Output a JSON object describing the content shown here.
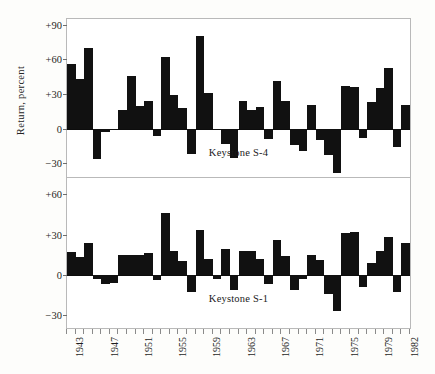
{
  "figure": {
    "y_axis_title": "Return, percent",
    "x_start_year": 1943,
    "x_end_year": 1982
  },
  "panels": [
    {
      "caption": "Keystone S-4",
      "y_ticks": [
        "+90",
        "+60",
        "+30",
        "0",
        "-30"
      ],
      "y_tick_values": [
        90,
        60,
        30,
        0,
        -30
      ]
    },
    {
      "caption": "Keystone S-1",
      "y_ticks": [
        "+60",
        "+30",
        "0",
        "-30"
      ],
      "y_tick_values": [
        60,
        30,
        0,
        -30
      ]
    }
  ],
  "x_tick_labels": [
    "1943",
    "1947",
    "1951",
    "1955",
    "1959",
    "1963",
    "1967",
    "1971",
    "1975",
    "1979",
    "1982"
  ],
  "colors": {
    "bar": "#111111",
    "frame": "#b9b9b9",
    "baseline": "#0d0d0d",
    "background": "#fdfdfb",
    "text": "#1a1a1a"
  },
  "chart_data": [
    {
      "type": "bar",
      "title": "Keystone S-4",
      "xlabel": "",
      "ylabel": "Return, percent",
      "ylim": [
        -40,
        95
      ],
      "yticks": [
        -30,
        0,
        30,
        60,
        90
      ],
      "grid": false,
      "legend": "none",
      "categories": [
        1943,
        1944,
        1945,
        1946,
        1947,
        1948,
        1949,
        1950,
        1951,
        1952,
        1953,
        1954,
        1955,
        1956,
        1957,
        1958,
        1959,
        1960,
        1961,
        1962,
        1963,
        1964,
        1965,
        1966,
        1967,
        1968,
        1969,
        1970,
        1971,
        1972,
        1973,
        1974,
        1975,
        1976,
        1977,
        1978,
        1979,
        1980,
        1981,
        1982
      ],
      "values": [
        56,
        43,
        70,
        -26,
        -3,
        -1,
        16,
        46,
        20,
        24,
        -6,
        62,
        29,
        18,
        -22,
        80,
        31,
        -1,
        -13,
        -25,
        24,
        16,
        19,
        -9,
        41,
        24,
        -14,
        -19,
        21,
        -10,
        -23,
        -38,
        37,
        36,
        -8,
        23,
        35,
        53,
        -16,
        21
      ],
      "series": [
        {
          "name": "Keystone S-4",
          "values": [
            56,
            43,
            70,
            -26,
            -3,
            -1,
            16,
            46,
            20,
            24,
            -6,
            62,
            29,
            18,
            -22,
            80,
            31,
            -1,
            -13,
            -25,
            24,
            16,
            19,
            -9,
            41,
            24,
            -14,
            -19,
            21,
            -10,
            -23,
            -38,
            37,
            36,
            -8,
            23,
            35,
            53,
            -16,
            21
          ]
        }
      ]
    },
    {
      "type": "bar",
      "title": "Keystone S-1",
      "xlabel": "",
      "ylabel": "Return, percent",
      "ylim": [
        -38,
        72
      ],
      "yticks": [
        -30,
        0,
        30,
        60
      ],
      "grid": false,
      "legend": "none",
      "categories": [
        1943,
        1944,
        1945,
        1946,
        1947,
        1948,
        1949,
        1950,
        1951,
        1952,
        1953,
        1954,
        1955,
        1956,
        1957,
        1958,
        1959,
        1960,
        1961,
        1962,
        1963,
        1964,
        1965,
        1966,
        1967,
        1968,
        1969,
        1970,
        1971,
        1972,
        1973,
        1974,
        1975,
        1976,
        1977,
        1978,
        1979,
        1980,
        1981,
        1982
      ],
      "values": [
        17,
        13,
        24,
        -3,
        -7,
        -6,
        15,
        15,
        15,
        16,
        -4,
        46,
        18,
        10,
        -13,
        33,
        12,
        -3,
        19,
        -11,
        18,
        18,
        12,
        -7,
        26,
        14,
        -11,
        -3,
        15,
        11,
        -14,
        -27,
        31,
        32,
        -9,
        9,
        18,
        28,
        -13,
        24
      ],
      "series": [
        {
          "name": "Keystone S-1",
          "values": [
            17,
            13,
            24,
            -3,
            -7,
            -6,
            15,
            15,
            15,
            16,
            -4,
            46,
            18,
            10,
            -13,
            33,
            12,
            -3,
            19,
            -11,
            18,
            18,
            12,
            -7,
            26,
            14,
            -11,
            -3,
            15,
            11,
            -14,
            -27,
            31,
            32,
            -9,
            9,
            18,
            28,
            -13,
            24
          ]
        }
      ]
    }
  ]
}
